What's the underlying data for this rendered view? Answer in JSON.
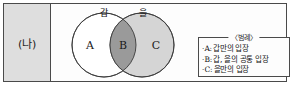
{
  "figure": {
    "row_label": "(나)",
    "diagram_type": "venn-two-set"
  },
  "venn": {
    "left_circle_label": "갑",
    "right_circle_label": "을",
    "regions": [
      {
        "key": "A",
        "label": "A",
        "meaning": "갑만의 입장",
        "fill": "#ffffff"
      },
      {
        "key": "B",
        "label": "B",
        "meaning": "갑, 을의 공통 입장",
        "fill": "#9a9a9a"
      },
      {
        "key": "C",
        "label": "C",
        "meaning": "을만의 입장",
        "fill": "#d5d5d5"
      }
    ],
    "stroke_color": "#3a3a3a"
  },
  "legend": {
    "title": "〈범례〉",
    "bullet": "·",
    "items": [
      {
        "key": "A:",
        "desc": "갑만의 입장"
      },
      {
        "key": "B:",
        "desc": "갑, 을의 공통 입장"
      },
      {
        "key": "C:",
        "desc": "을만의 입장"
      }
    ]
  },
  "colors": {
    "frame_border": "#4a4a4a",
    "label_cell_bg": "#dedede",
    "content_bg": "#fdfdfd",
    "text": "#1c1c1c"
  }
}
